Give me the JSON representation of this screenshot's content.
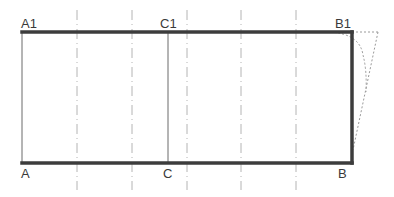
{
  "diagram": {
    "type": "pattern-draft",
    "colors": {
      "outline": "#3c3c3c",
      "thin": "#6a6a6a",
      "guide": "#b4b4b4",
      "dotted": "#9a9a9a"
    },
    "points": {
      "A": {
        "label": "A",
        "x": 22,
        "y": 163
      },
      "A1": {
        "label": "A1",
        "x": 22,
        "y": 32
      },
      "B": {
        "label": "B",
        "x": 352,
        "y": 163
      },
      "B1": {
        "label": "B1",
        "x": 352,
        "y": 32
      },
      "C": {
        "label": "C",
        "x": 168,
        "y": 163
      },
      "C1": {
        "label": "C1",
        "x": 168,
        "y": 32
      }
    },
    "guide_lines_x": [
      77,
      132,
      187,
      241,
      296
    ],
    "guide_y_range": [
      10,
      190
    ]
  }
}
